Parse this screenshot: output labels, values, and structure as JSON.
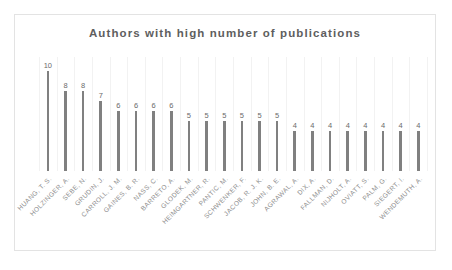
{
  "chart_data": {
    "type": "bar",
    "title": "Authors with high number of publications",
    "xlabel": "",
    "ylabel": "",
    "ylim": [
      0,
      10
    ],
    "grid": true,
    "legend": false,
    "categories": [
      "HUANG, T. S.",
      "HOLZINGER, A.",
      "SEBE, N.",
      "GRUDIN, J.",
      "CARROLL, J. M.",
      "GAINES, B. R.",
      "NASS, C.",
      "BARRETO, A.",
      "GLODEK, M.",
      "HEIMGARTNER, R.",
      "PANTIC, M.",
      "SCHWENKER, F.",
      "JACOB, R. J. K.",
      "JOHN, B. E.",
      "AGRAWAL, A.",
      "DIX, A.",
      "FALLMAN, D.",
      "NIJHOLT, A.",
      "OVIATT, S.",
      "PALM, G.",
      "SIEGERT, I.",
      "WENDEMUTH, A."
    ],
    "values": [
      10,
      8,
      8,
      7,
      6,
      6,
      6,
      6,
      5,
      5,
      5,
      5,
      5,
      5,
      4,
      4,
      4,
      4,
      4,
      4,
      4,
      4
    ],
    "colors": {
      "bar": "#808080",
      "gridline": "#f2f2f2",
      "title_text": "#5e5e5e",
      "value_text": "#6b6b6b",
      "label_text": "#8e8e8e",
      "frame_border": "#e3e3e3",
      "background": "#ffffff"
    }
  }
}
